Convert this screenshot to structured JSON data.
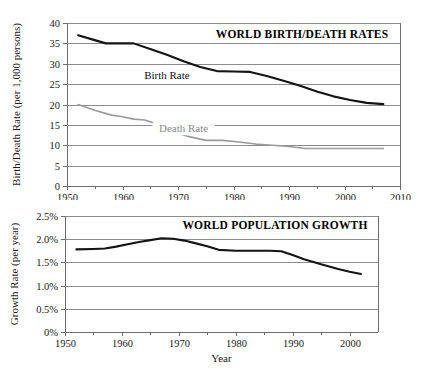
{
  "figure": {
    "background": "#ffffff",
    "panels": [
      "world-birth-death-rates",
      "world-population-growth"
    ]
  },
  "chart_data": [
    {
      "type": "line",
      "title": "WORLD BIRTH/DEATH RATES",
      "xlabel": "",
      "ylabel": "Birth/Death Rate (per 1,000 persons)",
      "xlim": [
        1950,
        2010
      ],
      "ylim": [
        0,
        40
      ],
      "xticks": [
        1950,
        1960,
        1970,
        1980,
        1990,
        2000,
        2010
      ],
      "xticklabels": [
        "1950",
        "1960",
        "1970",
        "1980",
        "1990",
        "2000",
        "2010"
      ],
      "yticks": [
        0,
        5,
        10,
        15,
        20,
        25,
        30,
        35,
        40
      ],
      "yticklabels": [
        "0",
        "5",
        "10",
        "15",
        "20",
        "25",
        "30",
        "35",
        "40"
      ],
      "grid": "horizontal",
      "legend": "inline-annotations",
      "series": [
        {
          "name": "Birth Rate",
          "color": "#141414",
          "label_x": 1968,
          "label_y": 26.2,
          "x": [
            1952,
            1955,
            1957,
            1960,
            1962,
            1965,
            1968,
            1971,
            1974,
            1977,
            1980,
            1983,
            1986,
            1989,
            1992,
            1995,
            1998,
            2001,
            2004,
            2007
          ],
          "y": [
            37.0,
            35.8,
            35.0,
            35.0,
            35.0,
            33.6,
            32.2,
            30.6,
            29.2,
            28.2,
            28.1,
            28.0,
            27.0,
            25.8,
            24.6,
            23.2,
            22.0,
            21.1,
            20.4,
            20.1
          ]
        },
        {
          "name": "Death Rate",
          "color": "#9b9b9b",
          "label_x": 1971,
          "label_y": 13.2,
          "x": [
            1952,
            1955,
            1958,
            1960,
            1962,
            1964,
            1966,
            1969,
            1972,
            1975,
            1978,
            1981,
            1984,
            1987,
            1990,
            1993,
            1996,
            2000,
            2004,
            2007
          ],
          "y": [
            20.0,
            18.6,
            17.4,
            17.0,
            16.4,
            16.2,
            15.3,
            13.4,
            12.1,
            11.2,
            11.2,
            10.8,
            10.3,
            10.0,
            9.7,
            9.2,
            9.2,
            9.2,
            9.2,
            9.2
          ]
        }
      ]
    },
    {
      "type": "line",
      "title": "WORLD POPULATION GROWTH",
      "xlabel": "Year",
      "ylabel": "Growth Rate (per year)",
      "xlim": [
        1950,
        2005
      ],
      "ylim": [
        0,
        2.5
      ],
      "xticks": [
        1950,
        1960,
        1970,
        1980,
        1990,
        2000
      ],
      "xticklabels": [
        "1950",
        "1960",
        "1970",
        "1980",
        "1990",
        "2000"
      ],
      "yticks": [
        0,
        0.5,
        1.0,
        1.5,
        2.0,
        2.5
      ],
      "yticklabels": [
        "0%",
        "0.5%",
        "1.0%",
        "1.5%",
        "2.0%",
        "2.5%"
      ],
      "grid": "horizontal",
      "legend": "none",
      "series": [
        {
          "name": "Growth Rate",
          "color": "#141414",
          "x": [
            1952,
            1955,
            1957,
            1959,
            1961,
            1963,
            1965,
            1967,
            1969,
            1971,
            1973,
            1975,
            1977,
            1980,
            1983,
            1986,
            1988,
            1990,
            1992,
            1995,
            1998,
            2000,
            2002
          ],
          "y": [
            1.78,
            1.79,
            1.8,
            1.84,
            1.89,
            1.94,
            1.98,
            2.02,
            2.01,
            1.97,
            1.91,
            1.85,
            1.77,
            1.75,
            1.75,
            1.75,
            1.74,
            1.66,
            1.57,
            1.46,
            1.36,
            1.3,
            1.25
          ]
        }
      ]
    }
  ]
}
